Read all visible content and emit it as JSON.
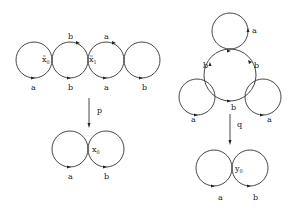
{
  "diagram": {
    "left_cover": {
      "vertices": [
        {
          "name": "x̃",
          "sub": "0",
          "x": 44,
          "y": 63
        },
        {
          "name": "x̃",
          "sub": "1",
          "x": 80,
          "y": 63
        }
      ],
      "loops": [
        {
          "cx": 34,
          "cy": 60,
          "label": "a",
          "lx": 32,
          "ly": 90
        },
        {
          "cx": 70,
          "cy": 60,
          "label": "b",
          "lx": 68,
          "ly": 90,
          "top_label": "b",
          "tx": 69,
          "ty": 36
        },
        {
          "cx": 106,
          "cy": 60,
          "label": "a",
          "lx": 104,
          "ly": 90,
          "top_label": "a",
          "tx": 106,
          "ty": 36
        },
        {
          "cx": 142,
          "cy": 60,
          "label": "b",
          "lx": 142,
          "ly": 90
        }
      ]
    },
    "map_p": {
      "label": "p",
      "x": 89,
      "y1": 98,
      "y2": 128,
      "lx": 96,
      "ly": 113
    },
    "left_base": {
      "vertex": {
        "name": "x",
        "sub": "0",
        "x": 90,
        "y": 152
      },
      "loops": [
        {
          "cx": 70,
          "cy": 149,
          "label": "a",
          "lx": 70,
          "ly": 179
        },
        {
          "cx": 106,
          "cy": 149,
          "label": "b",
          "lx": 106,
          "ly": 179
        }
      ]
    },
    "right_cover": {
      "loops": [
        {
          "cx": 230,
          "cy": 31,
          "r": 18,
          "label": "a",
          "lx": 252,
          "ly": 32
        },
        {
          "cx": 230,
          "cy": 76,
          "r": 26,
          "labels": [
            {
              "text": "b",
              "x": 203,
              "y": 67
            },
            {
              "text": "b",
              "x": 254,
              "y": 67
            },
            {
              "text": "b",
              "x": 231,
              "y": 109
            }
          ]
        },
        {
          "cx": 197,
          "cy": 97,
          "r": 18,
          "label": "a",
          "lx": 191,
          "ly": 121
        },
        {
          "cx": 263,
          "cy": 97,
          "r": 18,
          "label": "a",
          "lx": 267,
          "ly": 121
        }
      ]
    },
    "map_q": {
      "label": "q",
      "x": 230,
      "y1": 116,
      "y2": 145,
      "lx": 236,
      "ly": 127
    },
    "right_base": {
      "vertex": {
        "name": "y",
        "sub": "0",
        "x": 235,
        "y": 170
      },
      "loops": [
        {
          "cx": 214,
          "cy": 168,
          "label": "a",
          "lx": 219,
          "ly": 200
        },
        {
          "cx": 250,
          "cy": 168,
          "label": "b",
          "lx": 254,
          "ly": 200
        }
      ]
    }
  }
}
